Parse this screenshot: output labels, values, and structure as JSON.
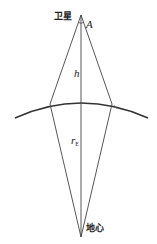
{
  "labels": {
    "satellite": "卫星",
    "angle": "A",
    "height": "h",
    "radius_main": "r",
    "radius_sub": "E",
    "earth_center": "地心"
  },
  "colors": {
    "stroke": "#333333",
    "background": "#ffffff"
  }
}
